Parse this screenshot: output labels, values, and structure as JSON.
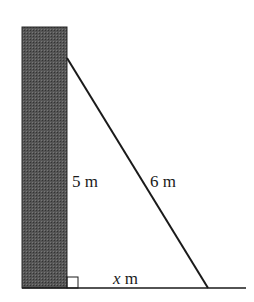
{
  "diagram": {
    "type": "right-triangle-ladder-wall",
    "labels": {
      "wall_height": "5 m",
      "ladder_length": "6 m",
      "base_var": "x",
      "base_unit": " m"
    },
    "colors": {
      "wall_fill": "#4a4a4a",
      "line": "#1a1a1a",
      "background": "#ffffff"
    }
  }
}
